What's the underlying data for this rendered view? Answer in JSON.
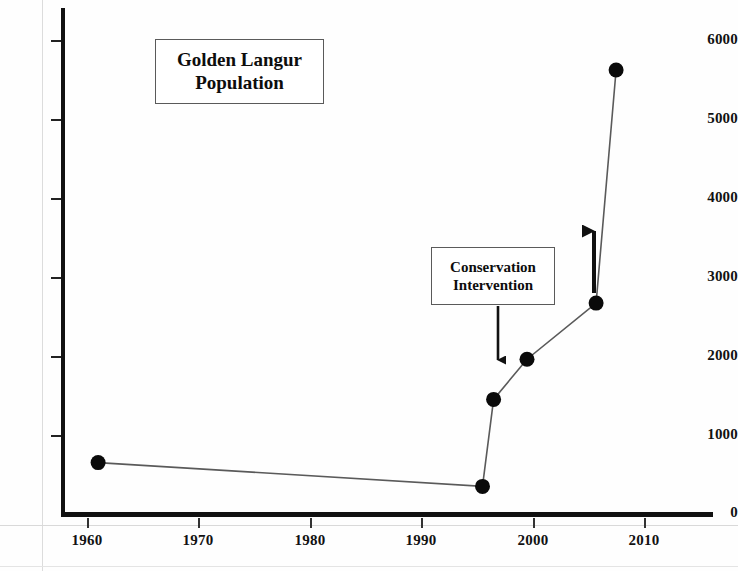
{
  "chart_data": {
    "type": "line",
    "title": "Golden Langur Population",
    "xlabel": "",
    "ylabel": "",
    "grid": false,
    "legend": "none",
    "xlim": [
      1956,
      2016
    ],
    "ylim": [
      0,
      6400
    ],
    "x_ticks": [
      1960,
      1970,
      1980,
      1990,
      2000,
      2010
    ],
    "y_ticks": [
      0,
      1000,
      2000,
      3000,
      4000,
      5000,
      6000
    ],
    "x": [
      1961,
      1995.5,
      1996.5,
      1999.5,
      2005.7,
      2007.5
    ],
    "values": [
      650,
      350,
      1450,
      1960,
      2670,
      5620
    ],
    "series": [
      {
        "name": "Golden Langur Population",
        "points": [
          {
            "year": 1961,
            "population": 650
          },
          {
            "year": 1995.5,
            "population": 350
          },
          {
            "year": 1996.5,
            "population": 1450
          },
          {
            "year": 1999.5,
            "population": 1960
          },
          {
            "year": 2005.7,
            "population": 2670
          },
          {
            "year": 2007.5,
            "population": 5620
          }
        ]
      }
    ],
    "annotations": [
      {
        "name": "conservation-intervention",
        "lines": [
          "Conservation",
          "Intervention"
        ],
        "arrow": "down",
        "points_to_year": 1996.5
      },
      {
        "name": "population-increase-arrow",
        "arrow": "up",
        "at_year": 2005.7
      }
    ]
  },
  "title_box": {
    "line1": "Golden Langur",
    "line2": "Population"
  },
  "intervention_box": {
    "line1": "Conservation",
    "line2": "Intervention"
  },
  "axes": {
    "y_labels": [
      "6000",
      "5000",
      "4000",
      "3000",
      "2000",
      "1000",
      "0"
    ],
    "x_labels": [
      "1960",
      "1970",
      "1980",
      "1990",
      "2000",
      "2010"
    ]
  },
  "colors": {
    "ink": "#111111",
    "line": "#555555",
    "marker": "#0a0a0a",
    "box_border": "#5a5a5a",
    "background": "#ffffff"
  }
}
